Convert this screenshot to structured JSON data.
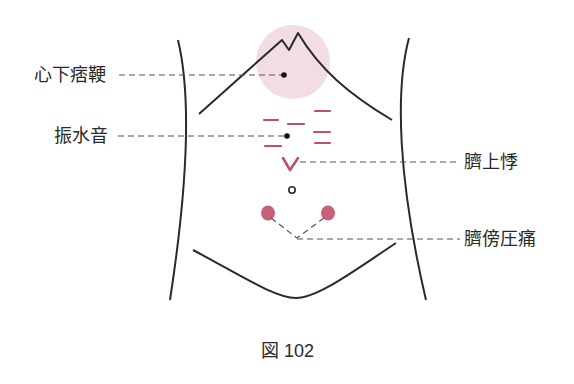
{
  "figure": {
    "caption": "図 102",
    "labels": {
      "shinka_hiko": "心下痞鞕",
      "shinsuion": "振水音",
      "seijoki": "臍上悸",
      "seibo_atsutsu": "臍傍圧痛"
    },
    "colors": {
      "outline": "#2a2a2a",
      "leader": "#555555",
      "mark": "#c0506a",
      "tender_spot": "#c9607a",
      "shaded_area": "#f2dde2"
    }
  }
}
